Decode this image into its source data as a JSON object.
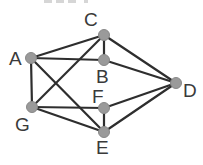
{
  "diagram": {
    "type": "undirected-graph",
    "colors": {
      "edge": "#2e2e2e",
      "node_fill": "#9a9a9a",
      "node_stroke": "#888888",
      "label": "#3a3a3a",
      "background": "#ffffff"
    },
    "nodes": [
      {
        "id": "A",
        "label": "A",
        "x": 31,
        "y": 58,
        "label_x": 9,
        "label_y": 65
      },
      {
        "id": "B",
        "label": "B",
        "x": 104,
        "y": 60,
        "label_x": 96,
        "label_y": 83
      },
      {
        "id": "C",
        "label": "C",
        "x": 104,
        "y": 35,
        "label_x": 84,
        "label_y": 26
      },
      {
        "id": "D",
        "label": "D",
        "x": 176,
        "y": 83,
        "label_x": 183,
        "label_y": 97
      },
      {
        "id": "E",
        "label": "E",
        "x": 104,
        "y": 132,
        "label_x": 96,
        "label_y": 154
      },
      {
        "id": "F",
        "label": "F",
        "x": 104,
        "y": 108,
        "label_x": 92,
        "label_y": 103
      },
      {
        "id": "G",
        "label": "G",
        "x": 32,
        "y": 107,
        "label_x": 15,
        "label_y": 131
      }
    ],
    "edges": [
      [
        "A",
        "C"
      ],
      [
        "A",
        "B"
      ],
      [
        "A",
        "G"
      ],
      [
        "A",
        "E"
      ],
      [
        "C",
        "B"
      ],
      [
        "C",
        "D"
      ],
      [
        "C",
        "G"
      ],
      [
        "B",
        "D"
      ],
      [
        "G",
        "F"
      ],
      [
        "G",
        "E"
      ],
      [
        "F",
        "E"
      ],
      [
        "F",
        "D"
      ],
      [
        "E",
        "D"
      ]
    ]
  }
}
